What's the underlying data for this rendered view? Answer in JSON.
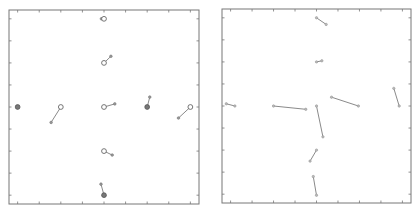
{
  "chart_data": [
    {
      "type": "scatter",
      "title": "",
      "xlabel": "",
      "ylabel": "",
      "xlim": [
        -4.4,
        4.4
      ],
      "ylim": [
        -4.4,
        4.4
      ],
      "xticks": [
        -4,
        -3,
        -2,
        -1,
        0,
        1,
        2,
        3,
        4
      ],
      "yticks": [
        -4,
        -3,
        -2,
        -1,
        0,
        1,
        2,
        3,
        4
      ],
      "tick_labels_shown": false,
      "grid": false,
      "description": "Displacement vectors from grid nodes (open circles) to displaced positions",
      "vectors": [
        {
          "start": [
            0,
            4
          ],
          "end": [
            -0.12,
            4.0
          ],
          "node": "open"
        },
        {
          "start": [
            0,
            2
          ],
          "end": [
            0.32,
            2.3
          ],
          "node": "open"
        },
        {
          "start": [
            -4,
            0
          ],
          "end": [
            -4,
            0
          ],
          "node": "filled"
        },
        {
          "start": [
            -2,
            0
          ],
          "end": [
            -2.45,
            -0.7
          ],
          "node": "open"
        },
        {
          "start": [
            0,
            0
          ],
          "end": [
            0.5,
            0.14
          ],
          "node": "open"
        },
        {
          "start": [
            2,
            0
          ],
          "end": [
            2.12,
            0.45
          ],
          "node": "filled"
        },
        {
          "start": [
            4,
            0
          ],
          "end": [
            3.45,
            -0.5
          ],
          "node": "open"
        },
        {
          "start": [
            0,
            -2
          ],
          "end": [
            0.38,
            -2.18
          ],
          "node": "open"
        },
        {
          "start": [
            0,
            -4
          ],
          "end": [
            -0.14,
            -3.5
          ],
          "node": "filled"
        }
      ]
    },
    {
      "type": "scatter",
      "title": "",
      "xlabel": "",
      "ylabel": "",
      "xlim": [
        -4.4,
        4.4
      ],
      "ylim": [
        -4.4,
        4.4
      ],
      "xticks": [
        -4,
        -3,
        -2,
        -1,
        0,
        1,
        2,
        3,
        4
      ],
      "yticks": [
        -4,
        -3,
        -2,
        -1,
        0,
        1,
        2,
        3,
        4
      ],
      "tick_labels_shown": false,
      "grid": false,
      "description": "Line segments between marker pairs",
      "segments": [
        {
          "start": [
            0,
            4
          ],
          "end": [
            0.45,
            3.7
          ]
        },
        {
          "start": [
            0,
            2
          ],
          "end": [
            0.25,
            2.05
          ]
        },
        {
          "start": [
            -4.2,
            0.1
          ],
          "end": [
            -3.8,
            0
          ]
        },
        {
          "start": [
            -2,
            0
          ],
          "end": [
            -0.5,
            -0.15
          ]
        },
        {
          "start": [
            0,
            0
          ],
          "end": [
            0.3,
            -1.4
          ]
        },
        {
          "start": [
            0.7,
            0.4
          ],
          "end": [
            1.95,
            0
          ]
        },
        {
          "start": [
            3.6,
            0.8
          ],
          "end": [
            3.85,
            0
          ]
        },
        {
          "start": [
            0,
            -2
          ],
          "end": [
            -0.3,
            -2.5
          ]
        },
        {
          "start": [
            -0.15,
            -3.2
          ],
          "end": [
            0,
            -4.05
          ]
        }
      ]
    }
  ]
}
